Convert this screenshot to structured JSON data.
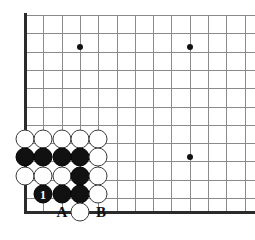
{
  "diagram": {
    "type": "go-board-problem",
    "board": {
      "origin_x": 25,
      "origin_y": 15,
      "spacing": 18.3,
      "cols": 13,
      "rows": 11,
      "left_edge_x": 25,
      "bottom_edge_y": 212,
      "line_color": "#8a8a8a",
      "edge_color": "#2b2b2b"
    },
    "star_points": [
      {
        "x": 80,
        "y": 47
      },
      {
        "x": 190,
        "y": 47
      },
      {
        "x": 190,
        "y": 157
      }
    ],
    "stones": [
      {
        "x": 25,
        "y": 139,
        "color": "white",
        "label": ""
      },
      {
        "x": 43,
        "y": 139,
        "color": "white",
        "label": ""
      },
      {
        "x": 62,
        "y": 139,
        "color": "white",
        "label": ""
      },
      {
        "x": 80,
        "y": 139,
        "color": "white",
        "label": ""
      },
      {
        "x": 98,
        "y": 139,
        "color": "white",
        "label": ""
      },
      {
        "x": 25,
        "y": 157,
        "color": "black",
        "label": ""
      },
      {
        "x": 43,
        "y": 157,
        "color": "black",
        "label": ""
      },
      {
        "x": 62,
        "y": 157,
        "color": "black",
        "label": ""
      },
      {
        "x": 80,
        "y": 157,
        "color": "black",
        "label": ""
      },
      {
        "x": 98,
        "y": 157,
        "color": "white",
        "label": ""
      },
      {
        "x": 25,
        "y": 176,
        "color": "white",
        "label": ""
      },
      {
        "x": 43,
        "y": 176,
        "color": "white",
        "label": ""
      },
      {
        "x": 62,
        "y": 176,
        "color": "white",
        "label": ""
      },
      {
        "x": 80,
        "y": 176,
        "color": "black",
        "label": ""
      },
      {
        "x": 98,
        "y": 176,
        "color": "white",
        "label": ""
      },
      {
        "x": 43,
        "y": 194,
        "color": "black",
        "label": "1"
      },
      {
        "x": 62,
        "y": 194,
        "color": "black",
        "label": ""
      },
      {
        "x": 80,
        "y": 194,
        "color": "black",
        "label": ""
      },
      {
        "x": 98,
        "y": 194,
        "color": "white",
        "label": ""
      },
      {
        "x": 80,
        "y": 212,
        "color": "white",
        "label": ""
      }
    ],
    "point_labels": [
      {
        "x": 62,
        "y": 212,
        "text": "A"
      },
      {
        "x": 101,
        "y": 212,
        "text": "B"
      }
    ]
  }
}
